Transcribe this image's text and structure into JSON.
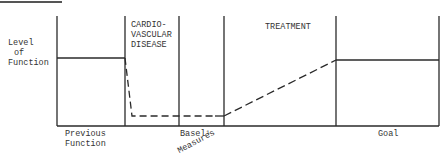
{
  "diagram": {
    "y_axis_label": [
      "Level",
      "of",
      "Function"
    ],
    "phases": [
      {
        "id": "previous",
        "label": "",
        "bottom_label": [
          "Previous",
          "Function"
        ]
      },
      {
        "id": "cvd",
        "label": [
          "CARDIO-",
          "VASCULAR",
          "DISEASE"
        ],
        "bottom_label": []
      },
      {
        "id": "baseline",
        "label": "",
        "bottom_label": [
          "Basel¹",
          "Measures"
        ]
      },
      {
        "id": "treatment",
        "label": [
          "TREATMENT"
        ],
        "bottom_label": []
      },
      {
        "id": "goal",
        "label": "",
        "bottom_label": [
          "Goal"
        ]
      }
    ],
    "colors": {
      "line": "#2a2a2a",
      "background": "#ffffff"
    }
  }
}
